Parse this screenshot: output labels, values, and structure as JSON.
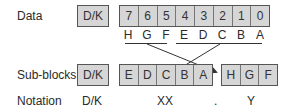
{
  "rows": {
    "data_label": "Data",
    "subblocks_label": "Sub-blocks",
    "notation_label": "Notation"
  },
  "data_row": {
    "dk": "D/K",
    "bits": [
      "7",
      "6",
      "5",
      "4",
      "3",
      "2",
      "1",
      "0"
    ],
    "letters": [
      "H",
      "G",
      "F",
      "E",
      "D",
      "C",
      "B",
      "A"
    ]
  },
  "subblocks_row": {
    "dk": "D/K",
    "group_xx": [
      "E",
      "D",
      "C",
      "B",
      "A"
    ],
    "group_y": [
      "H",
      "G",
      "F"
    ]
  },
  "notation_row": {
    "dk": "D/K",
    "xx": "XX",
    "dot": ".",
    "y": "Y"
  },
  "colors": {
    "cell_fill": "#d6d6d6",
    "border": "#555555",
    "line": "#333333"
  }
}
